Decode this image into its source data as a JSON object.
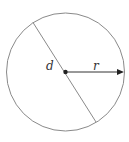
{
  "diagram": {
    "type": "circle-radius-diameter",
    "labels": {
      "diameter": "d",
      "radius": "r"
    },
    "colors": {
      "circle_stroke": "#888888",
      "radius_arrow": "#333333",
      "center_dot": "#222222"
    }
  }
}
